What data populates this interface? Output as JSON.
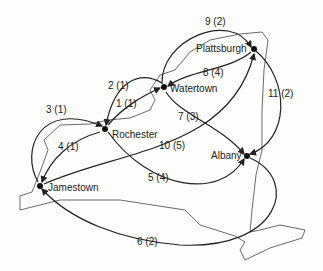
{
  "nodes": [
    {
      "id": "rochester",
      "label": "Rochester",
      "x": 105,
      "y": 129
    },
    {
      "id": "watertown",
      "label": "Watertown",
      "x": 164,
      "y": 87
    },
    {
      "id": "plattsburgh",
      "label": "Plattsburgh",
      "x": 254,
      "y": 49
    },
    {
      "id": "albany",
      "label": "Albany",
      "x": 247,
      "y": 156
    },
    {
      "id": "jamestown",
      "label": "Jamestown",
      "x": 40,
      "y": 186
    }
  ],
  "edges": [
    {
      "label": "1 (1)",
      "from": "rochester",
      "to": "watertown"
    },
    {
      "label": "2 (1)",
      "from": "watertown",
      "to": "rochester"
    },
    {
      "label": "3 (1)",
      "from": "jamestown",
      "to": "rochester"
    },
    {
      "label": "4 (1)",
      "from": "rochester",
      "to": "jamestown"
    },
    {
      "label": "5 (4)",
      "from": "rochester",
      "to": "albany"
    },
    {
      "label": "6 (2)",
      "from": "albany",
      "to": "jamestown"
    },
    {
      "label": "7 (3)",
      "from": "watertown",
      "to": "albany"
    },
    {
      "label": "8 (4)",
      "from": "plattsburgh",
      "to": "watertown"
    },
    {
      "label": "9 (2)",
      "from": "watertown",
      "to": "plattsburgh"
    },
    {
      "label": "10 (5)",
      "from": "jamestown",
      "to": "plattsburgh"
    },
    {
      "label": "11 (2)",
      "from": "plattsburgh",
      "to": "albany"
    }
  ]
}
